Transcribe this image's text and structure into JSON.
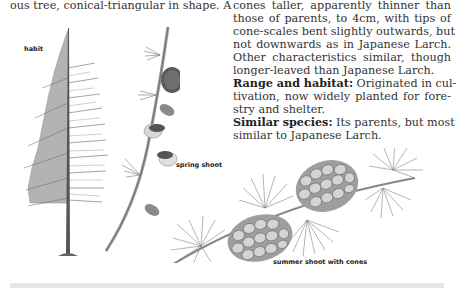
{
  "page": {
    "left_text": "ous tree, conical-triangular in shape. A",
    "right_text": {
      "lines": [
        "cones taller, apparently thinner than",
        "those of parents, to 4cm, with tips of",
        "cone-scales bent slightly outwards, but",
        "not downwards as in Japanese Larch.",
        "Other characteristics similar, though",
        "longer-leaved than Japanese Larch."
      ],
      "range_label": "Range and habitat:",
      "range_lines": [
        " Originated in cul-",
        "tivation, now widely planted for fore-",
        "stry and shelter."
      ],
      "similar_label": "Similar species:",
      "similar_lines": [
        " Its parents, but most",
        "similar to Japanese Larch."
      ]
    },
    "captions": {
      "habit": "habit",
      "spring_shoot": "spring shoot",
      "summer_shoot": "summer shoot with cones"
    },
    "illustrations": [
      {
        "name": "habit-tree-illustration",
        "caption": "habit"
      },
      {
        "name": "spring-shoot-illustration",
        "caption": "spring shoot"
      },
      {
        "name": "summer-shoot-illustration",
        "caption": "summer shoot with cones"
      }
    ]
  }
}
